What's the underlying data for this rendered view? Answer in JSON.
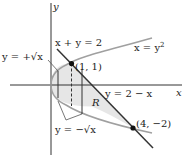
{
  "diagram": {
    "axes": {
      "x_label": "x",
      "y_label": "y"
    },
    "curves": {
      "parabola": "x = y",
      "parabola_exp": "2",
      "line": "x + y = 2",
      "line_alt": "y = 2 − x",
      "upper_branch": "y = +√x",
      "lower_branch": "y = −√x"
    },
    "points": [
      {
        "label": "(1, 1)",
        "x": 1,
        "y": 1
      },
      {
        "label": "(4, −2)",
        "x": 4,
        "y": -2
      }
    ],
    "region_label": "R",
    "colors": {
      "axes": "#333333",
      "line": "#333333",
      "parabola": "#a0a0a0",
      "region_fill": "#e6e6e6",
      "text": "#222222"
    }
  }
}
